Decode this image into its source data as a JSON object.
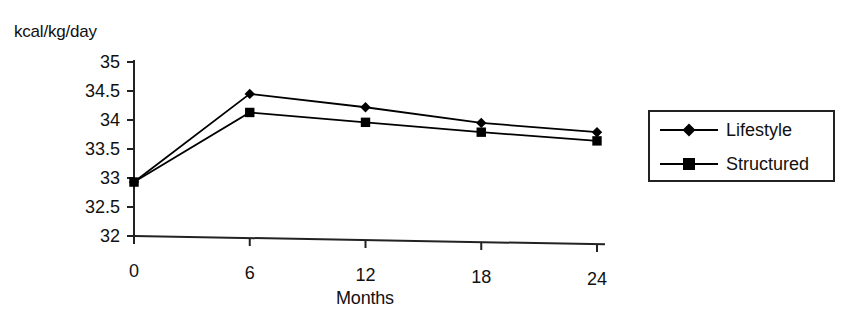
{
  "chart_data": {
    "type": "line",
    "title": "",
    "xlabel": "Months",
    "ylabel": "kcal/kg/day",
    "x": [
      0,
      6,
      12,
      18,
      24
    ],
    "xticklabels": [
      "0",
      "6",
      "12",
      "18",
      "24"
    ],
    "yticklabels": [
      "32",
      "32.5",
      "33",
      "33.5",
      "34",
      "34.5",
      "35"
    ],
    "yticks": [
      32,
      32.5,
      33,
      33.5,
      34,
      34.5,
      35
    ],
    "ylim": [
      32,
      35
    ],
    "xlim": [
      0,
      24
    ],
    "grid": false,
    "legend_position": "right-outside",
    "series": [
      {
        "name": "Lifestyle",
        "marker": "diamond",
        "color": "#000000",
        "values": [
          32.93,
          34.45,
          34.22,
          33.95,
          33.79
        ]
      },
      {
        "name": "Structured",
        "marker": "square",
        "color": "#000000",
        "values": [
          32.93,
          34.13,
          33.96,
          33.79,
          33.64
        ]
      }
    ]
  },
  "axes": {
    "y_title": "kcal/kg/day",
    "x_title": "Months"
  },
  "legend": {
    "entries": [
      {
        "label": "Lifestyle",
        "marker": "diamond"
      },
      {
        "label": "Structured",
        "marker": "square"
      }
    ]
  },
  "colors": {
    "ink": "#000000",
    "background": "#ffffff",
    "axis": "#222222"
  }
}
